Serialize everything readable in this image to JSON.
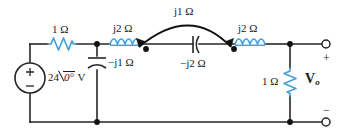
{
  "diagram": {
    "colors": {
      "wire": "#262626",
      "component_blue": "#4a9fd4",
      "text": "#1a1a1a",
      "background": "#ffffff"
    }
  },
  "source": {
    "name": "independent-voltage-source",
    "magnitude": "24",
    "angle": "0°",
    "unit": "V",
    "plus_sign": "+",
    "minus_sign": "−"
  },
  "components": {
    "series_resistor": {
      "label": "1 Ω",
      "type": "resistor"
    },
    "shunt_capacitor": {
      "label": "−j1 Ω",
      "type": "capacitor"
    },
    "left_inductor": {
      "label": "j2 Ω",
      "type": "inductor"
    },
    "series_capacitor": {
      "label": "−j2 Ω",
      "type": "capacitor"
    },
    "right_inductor": {
      "label": "j2 Ω",
      "type": "inductor"
    },
    "mutual_coupling": {
      "label": "j1 Ω",
      "type": "mutual-inductance"
    },
    "load_resistor": {
      "label": "1 Ω",
      "type": "resistor"
    }
  },
  "output": {
    "label_main": "V",
    "label_sub": "o",
    "plus_sign": "+",
    "minus_sign": "−"
  }
}
